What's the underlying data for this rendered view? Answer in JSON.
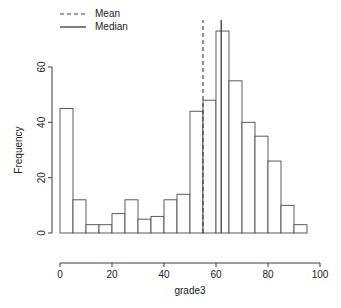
{
  "chart_data": {
    "type": "bar",
    "title": "",
    "xlabel": "grade3",
    "ylabel": "Frequency",
    "xlim": [
      0,
      100
    ],
    "ylim": [
      0,
      75
    ],
    "grid": false,
    "bin_width": 5,
    "bin_edges": [
      0,
      5,
      10,
      15,
      20,
      25,
      30,
      35,
      40,
      45,
      50,
      55,
      60,
      65,
      70,
      75,
      80,
      85,
      90,
      95
    ],
    "categories": [
      "0-5",
      "5-10",
      "10-15",
      "15-20",
      "20-25",
      "25-30",
      "30-35",
      "35-40",
      "40-45",
      "45-50",
      "50-55",
      "55-60",
      "60-65",
      "65-70",
      "70-75",
      "75-80",
      "80-85",
      "85-90",
      "90-95"
    ],
    "values": [
      45,
      12,
      3,
      3,
      7,
      12,
      5,
      6,
      12,
      14,
      44,
      48,
      73,
      55,
      40,
      35,
      26,
      10,
      3
    ],
    "xticks": [
      0,
      20,
      40,
      60,
      80,
      100
    ],
    "xtick_labels": [
      "0",
      "20",
      "40",
      "60",
      "80",
      "100"
    ],
    "yticks": [
      0,
      20,
      40,
      60
    ],
    "ytick_labels": [
      "0",
      "20",
      "40",
      "60"
    ],
    "annotations": [
      {
        "name": "mean",
        "label": "Mean",
        "value": 55,
        "style": "dashed"
      },
      {
        "name": "median",
        "label": "Median",
        "value": 62,
        "style": "solid"
      }
    ],
    "legend": {
      "position": "top-left",
      "entries": [
        {
          "label": "Mean",
          "style": "dashed"
        },
        {
          "label": "Median",
          "style": "solid"
        }
      ]
    },
    "colors": {
      "bar_fill": "#ffffff",
      "bar_stroke": "#4a4a4a",
      "axis": "#3d3d3d",
      "annotation": "#3a3a3a",
      "text": "#222222"
    }
  }
}
